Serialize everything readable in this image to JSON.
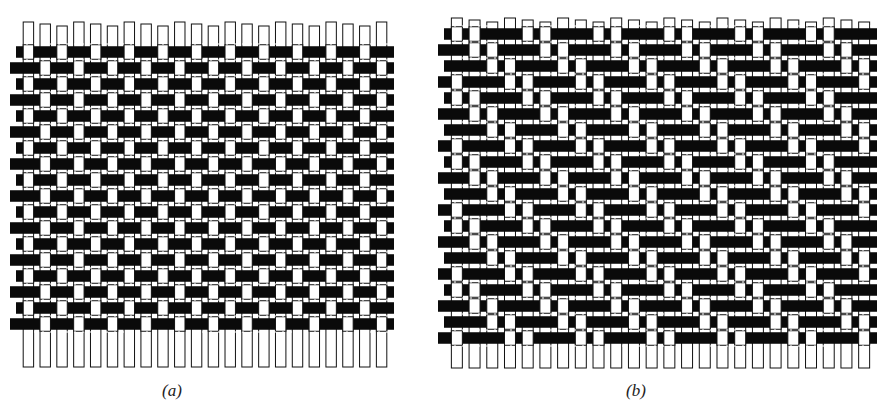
{
  "figure": {
    "panels": [
      {
        "id": "a",
        "caption": "(a)",
        "weave_type": "plain",
        "x": 20,
        "y": 22,
        "width": 370,
        "height": 345,
        "columns": 22,
        "rows": 20,
        "warp_pitch": 16,
        "weft_pitch": 16,
        "weft_start_y": 44,
        "weft_rows": 18,
        "caption_x": 172,
        "caption_y": 381
      },
      {
        "id": "b",
        "caption": "(b)",
        "weave_type": "twill-2/2",
        "x": 448,
        "y": 18,
        "width": 425,
        "height": 350,
        "columns": 24,
        "rows": 21,
        "warp_pitch": 16.5,
        "weft_pitch": 16,
        "weft_start_y": 26,
        "weft_rows": 20,
        "caption_x": 636,
        "caption_y": 381
      }
    ],
    "colors": {
      "weft": "#0a0a0a",
      "warp": "#ffffff",
      "outline": "#111111",
      "background": "#ffffff"
    }
  }
}
